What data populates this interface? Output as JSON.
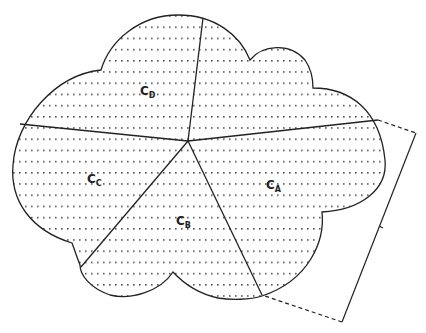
{
  "diagram": {
    "type": "partitioned-cloud",
    "fill_pattern": "dotted-horizontal-lines",
    "colors": {
      "stroke": "#222222",
      "dots": "#555555",
      "background": "#ffffff"
    },
    "regions": [
      {
        "id": "C_A",
        "main": "C",
        "sub": "A"
      },
      {
        "id": "C_B",
        "main": "C",
        "sub": "B"
      },
      {
        "id": "C_C",
        "main": "C",
        "sub": "C"
      },
      {
        "id": "C_D",
        "main": "C",
        "sub": "D"
      }
    ],
    "bracket": {
      "style": "dashed-to-solid",
      "side": "right"
    }
  }
}
